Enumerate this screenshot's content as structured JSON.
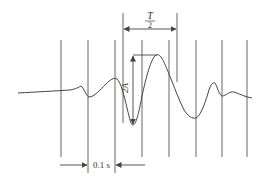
{
  "diagram": {
    "title": "",
    "colors": {
      "line": "#444444",
      "background": "#ffffff",
      "text": "#333333"
    },
    "labels": {
      "half_period_numerator": "T",
      "half_period_denominator": "2",
      "amplitude": "2A",
      "time_interval": "0.1 s"
    },
    "grid_lines_x": [
      61,
      88,
      115,
      142,
      169,
      196,
      222,
      247
    ],
    "half_period_markers_x": [
      123,
      177
    ],
    "waveform_description": "Seismogram-like trace: flat left, small dip at 88, rise to 115, deep trough at ~133, peak at ~158, trough at ~196, small spike at ~214, small dip at ~222, tail to right"
  }
}
